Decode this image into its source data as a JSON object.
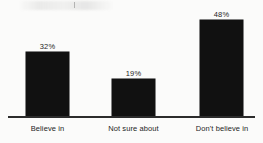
{
  "chart_data": {
    "type": "bar",
    "title": "",
    "subtitle": "",
    "xlabel": "",
    "ylabel": "",
    "categories": [
      "Believe in",
      "Not sure about",
      "Don't believe in"
    ],
    "values": [
      32,
      19,
      48
    ],
    "value_labels": [
      "32%",
      "19%",
      "48%"
    ],
    "ylim": [
      0,
      55
    ],
    "grid": false,
    "legend": null,
    "bar_color": "#111111",
    "axis_color": "#2c2c2c",
    "background_color": "#fbfbfa",
    "text_color": "#1e1e1e"
  },
  "bars": [
    {
      "category": "Believe in",
      "value": 32,
      "value_label": "32%"
    },
    {
      "category": "Not sure about",
      "value": 19,
      "value_label": "19%"
    },
    {
      "category": "Don't believe in",
      "value": 48,
      "value_label": "48%"
    }
  ]
}
